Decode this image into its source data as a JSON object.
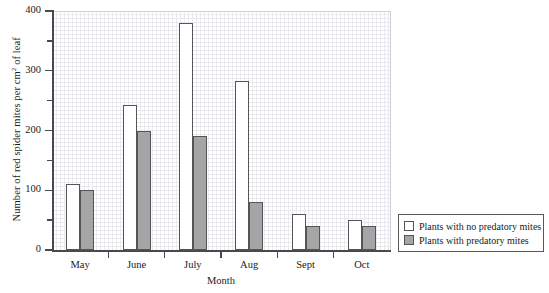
{
  "chart_data": {
    "type": "bar",
    "title": "",
    "xlabel": "Month",
    "ylabel": "Number of red spider mites per cm2 of leaf",
    "ylabel_prefix": "Number of red spider mites per cm",
    "ylabel_superscript": "2",
    "ylabel_suffix": " of leaf",
    "categories": [
      "May",
      "June",
      "July",
      "Aug",
      "Sept",
      "Oct"
    ],
    "ylim": [
      0,
      400
    ],
    "yticks": [
      0,
      100,
      200,
      300,
      400
    ],
    "ytick_labels": [
      "0",
      "100",
      "200",
      "300",
      "400"
    ],
    "yticks_minor": [
      50,
      150,
      250,
      350
    ],
    "grid": true,
    "grid_style": "graph-paper",
    "legend_position": "outside-right-bottom",
    "series": [
      {
        "name": "Plants with no predatory mites",
        "color": "#ffffff",
        "edge_color": "#555555",
        "values": [
          110,
          243,
          380,
          283,
          60,
          50
        ]
      },
      {
        "name": "Plants with predatory mites",
        "color": "#a5a5a5",
        "edge_color": "#555555",
        "values": [
          100,
          200,
          190,
          80,
          40,
          40
        ]
      }
    ]
  },
  "legend": {
    "items": [
      {
        "label": "Plants with no predatory mites",
        "swatch": "light"
      },
      {
        "label": "Plants with predatory mites",
        "swatch": "dark"
      }
    ]
  }
}
